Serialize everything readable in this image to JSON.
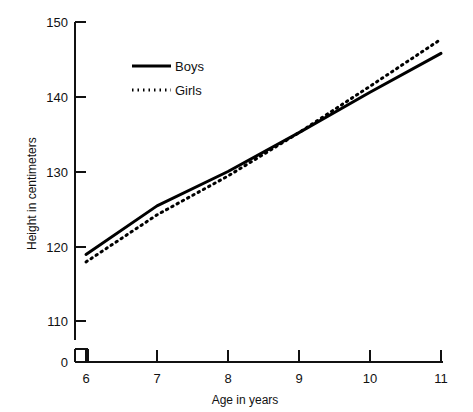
{
  "chart_data": {
    "type": "line",
    "title": "",
    "xlabel": "Age in years",
    "ylabel": "Height in centimeters",
    "x": [
      6,
      7,
      8,
      9,
      10,
      11
    ],
    "xtick_labels": [
      "6",
      "7",
      "8",
      "9",
      "10",
      "11"
    ],
    "ytick_labels": [
      "0",
      "110",
      "120",
      "130",
      "140",
      "150"
    ],
    "xlim": [
      6,
      11
    ],
    "ylim": [
      110,
      150
    ],
    "yaxis_break": true,
    "yaxis_break_note": "0",
    "grid": false,
    "legend_position": "upper-left-inside",
    "series": [
      {
        "name": "Boys",
        "style": "solid",
        "color": "#000000",
        "values": [
          118.9,
          125.4,
          130.0,
          135.2,
          140.6,
          145.8
        ]
      },
      {
        "name": "Girls",
        "style": "dotted",
        "color": "#000000",
        "values": [
          117.9,
          124.2,
          129.4,
          135.2,
          141.4,
          147.7
        ]
      }
    ]
  },
  "axes": {
    "y_title": "Height in centimeters",
    "x_title": "Age in years"
  },
  "legend": {
    "entries": [
      {
        "label": "Boys",
        "style": "solid"
      },
      {
        "label": "Girls",
        "style": "dotted"
      }
    ]
  },
  "colors": {
    "ink": "#000000",
    "background": "#ffffff"
  }
}
